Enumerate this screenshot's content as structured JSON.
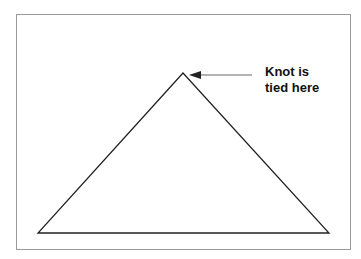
{
  "diagram": {
    "annotation": {
      "line1": "Knot is",
      "line2": "tied here"
    },
    "triangle": {
      "apex": [
        183,
        73
      ],
      "base_left": [
        38,
        233
      ],
      "base_right": [
        329,
        233
      ]
    },
    "arrow": {
      "from": [
        252,
        75
      ],
      "to": [
        190,
        75
      ]
    },
    "colors": {
      "line": "#222222",
      "arrow": "#555555",
      "frame": "#9a9a9a"
    }
  }
}
